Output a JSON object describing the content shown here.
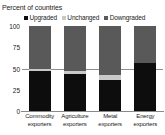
{
  "axis_title": "Percent of countries",
  "legend": {
    "items": [
      {
        "label": "Upgraded",
        "color": "#0d0d0d",
        "icon": "square-marker-icon"
      },
      {
        "label": "Unchanged",
        "color": "#c9c9c9",
        "icon": "square-marker-icon"
      },
      {
        "label": "Downgraded",
        "color": "#595959",
        "icon": "square-marker-icon"
      }
    ]
  },
  "colors": {
    "upgraded": "#0d0d0d",
    "unchanged": "#c9c9c9",
    "downgraded": "#595959",
    "axis": "#8a8a8a",
    "reference_line": "#8f8f8f",
    "text": "#222222",
    "background": "#ffffff"
  },
  "yticks": [
    "100",
    "75",
    "50",
    "25",
    "0"
  ],
  "categories_display": [
    {
      "line1": "Commodity",
      "line2": "exporters"
    },
    {
      "line1": "Agriculture",
      "line2": "exporters"
    },
    {
      "line1": "Metal",
      "line2": "exporters"
    },
    {
      "line1": "Energy",
      "line2": "exporters"
    }
  ],
  "chart_data": {
    "type": "bar",
    "subtype": "stacked-vertical",
    "title": "",
    "subtitle": "",
    "xlabel": "",
    "ylabel": "Percent of countries",
    "ylim": [
      0,
      100
    ],
    "yticks": [
      0,
      25,
      50,
      75,
      100
    ],
    "grid": false,
    "legend_position": "top-center",
    "stacked_total": 100,
    "categories": [
      "Commodity exporters",
      "Agriculture exporters",
      "Metal exporters",
      "Energy exporters"
    ],
    "series": [
      {
        "name": "Upgraded",
        "color": "#0d0d0d",
        "values": [
          47,
          43,
          37,
          56
        ]
      },
      {
        "name": "Unchanged",
        "color": "#c9c9c9",
        "values": [
          3,
          4,
          5,
          1
        ]
      },
      {
        "name": "Downgraded",
        "color": "#595959",
        "values": [
          50,
          53,
          58,
          43
        ]
      }
    ],
    "annotations": [
      {
        "type": "reference-line",
        "orientation": "horizontal",
        "value": 50,
        "color": "#8f8f8f"
      }
    ]
  }
}
